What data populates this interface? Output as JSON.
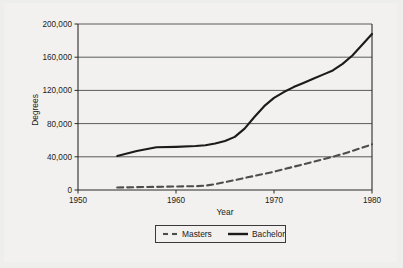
{
  "chart_data": {
    "type": "line",
    "title": "",
    "xlabel": "Year",
    "ylabel": "Degrees",
    "xlim": [
      1950,
      1980
    ],
    "ylim": [
      0,
      200000
    ],
    "xticks": [
      "1950",
      "1960",
      "1970",
      "1980"
    ],
    "xtick_values": [
      1950,
      1960,
      1970,
      1980
    ],
    "yticks": [
      "0",
      "40,000",
      "80,000",
      "120,000",
      "160,000",
      "200,000"
    ],
    "ytick_values": [
      0,
      40000,
      80000,
      120000,
      160000,
      200000
    ],
    "grid": "horizontal",
    "legend_position": "below-axes",
    "series": [
      {
        "name": "Masters",
        "style": "dashed",
        "color": "#4d4d4d",
        "x": [
          1954,
          1956,
          1958,
          1960,
          1962,
          1963,
          1964,
          1965,
          1966,
          1967,
          1968,
          1969,
          1970,
          1971,
          1972,
          1973,
          1974,
          1975,
          1976,
          1977,
          1978,
          1979,
          1980
        ],
        "values": [
          3000,
          3400,
          3800,
          4200,
          4600,
          5200,
          7000,
          9500,
          12000,
          14500,
          17000,
          19500,
          22000,
          25000,
          28000,
          31000,
          34000,
          37000,
          40000,
          43500,
          47000,
          51000,
          55000
        ]
      },
      {
        "name": "Bachelor",
        "style": "solid",
        "color": "#1b1b1b",
        "x": [
          1954,
          1956,
          1958,
          1960,
          1962,
          1963,
          1964,
          1965,
          1966,
          1967,
          1968,
          1969,
          1970,
          1971,
          1972,
          1973,
          1974,
          1975,
          1976,
          1977,
          1978,
          1979,
          1980
        ],
        "values": [
          41000,
          47000,
          51500,
          52000,
          53000,
          54000,
          56000,
          59000,
          64000,
          74000,
          88000,
          101000,
          111000,
          118000,
          124000,
          129000,
          134000,
          139000,
          144000,
          152000,
          162000,
          175000,
          188000
        ]
      }
    ]
  },
  "axes": {
    "y_title": "Degrees",
    "x_title": "Year"
  },
  "legend": {
    "masters_label": "Masters",
    "bachelor_label": "Bachelor"
  }
}
